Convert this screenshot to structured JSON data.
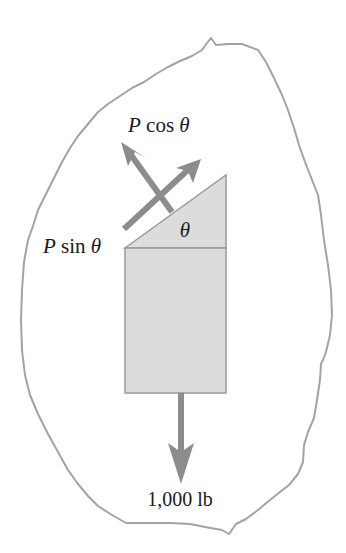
{
  "figure": {
    "type": "free-body-diagram",
    "colors": {
      "background": "#ffffff",
      "outline": "#a3a3a3",
      "block_fill": "#dcdcdc",
      "block_stroke": "#9a9a9a",
      "arrow": "#8c8c8c",
      "text": "#1a1a1a"
    },
    "labels": {
      "p_cos": {
        "var": "P",
        "func": "cos",
        "angle": "θ"
      },
      "p_sin": {
        "var": "P",
        "func": "sin",
        "angle": "θ"
      },
      "angle": "θ",
      "weight": "1,000 lb"
    }
  }
}
